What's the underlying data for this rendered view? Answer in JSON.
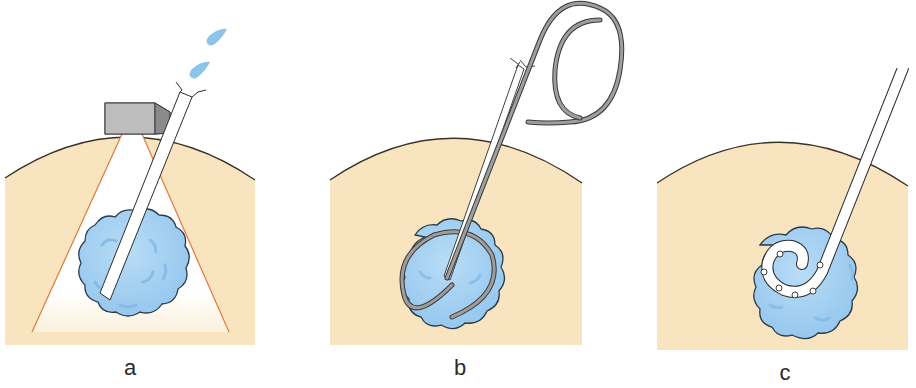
{
  "figure": {
    "panels": [
      {
        "id": "a",
        "label": "a",
        "description": "Needle inserted into tumor under ultrasound probe guidance, fluid droplets at needle hub"
      },
      {
        "id": "b",
        "label": "b",
        "description": "Guidewire passed through needle and coiled within tumor"
      },
      {
        "id": "c",
        "label": "c",
        "description": "Pigtail drainage catheter with side holes coiled within tumor"
      }
    ],
    "colors": {
      "tissue": "#f8e4bf",
      "tissue_edge": "#3a3226",
      "tumor": "#a9d3f2",
      "tumor_dark": "#7fb8e6",
      "tumor_edge": "#2b3a48",
      "probe": "#b9b9b9",
      "probe_side": "#8e8e8e",
      "beam_edge": "#e07a3c",
      "wire": "#8a8a8a",
      "droplet": "#8cc5ec"
    }
  }
}
